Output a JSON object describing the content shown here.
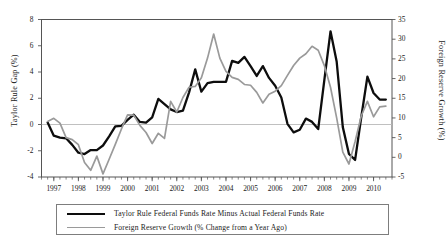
{
  "chart_data": {
    "type": "line",
    "title": "",
    "xlabel": "",
    "ylabel": "Taylor Rule Gap (%)",
    "y2label": "Foreign Reserve Growth (%)",
    "xlim": [
      1996.5,
      2010.75
    ],
    "ylim": [
      -4,
      8
    ],
    "y2lim": [
      -5,
      35
    ],
    "grid": false,
    "zero_line": true,
    "legend_position": "below-center",
    "y_ticks": [
      -4,
      -2,
      0,
      2,
      4,
      6,
      8
    ],
    "y2_ticks": [
      -5,
      0,
      5,
      10,
      15,
      20,
      25,
      30,
      35
    ],
    "x_ticks": [
      1997,
      1998,
      1999,
      2000,
      2001,
      2002,
      2003,
      2004,
      2005,
      2006,
      2007,
      2008,
      2009,
      2010
    ],
    "x_tick_labels": [
      "1997",
      "1998",
      "1999",
      "2000",
      "2001",
      "2002",
      "2003",
      "2004",
      "2005",
      "2006",
      "2007",
      "2008",
      "2009",
      "2010"
    ],
    "x_minor_tick_interval": 0.25,
    "series": [
      {
        "name": "Taylor Rule Federal Funds Rate Minus Actual Federal Funds Rate",
        "axis": "left",
        "color": "#0d0d0d",
        "width": 2.3,
        "x": [
          1996.75,
          1997.0,
          1997.25,
          1997.5,
          1997.75,
          1998.0,
          1998.25,
          1998.5,
          1998.75,
          1999.0,
          1999.25,
          1999.5,
          1999.75,
          2000.0,
          2000.25,
          2000.5,
          2000.75,
          2001.0,
          2001.25,
          2001.5,
          2001.75,
          2002.0,
          2002.25,
          2002.5,
          2002.75,
          2003.0,
          2003.25,
          2003.5,
          2003.75,
          2004.0,
          2004.25,
          2004.5,
          2004.75,
          2005.0,
          2005.25,
          2005.5,
          2005.75,
          2006.0,
          2006.25,
          2006.5,
          2006.75,
          2007.0,
          2007.25,
          2007.5,
          2007.75,
          2008.0,
          2008.25,
          2008.5,
          2008.75,
          2009.0,
          2009.25,
          2009.5,
          2009.75,
          2010.0,
          2010.25,
          2010.5
        ],
        "values": [
          0.15,
          -0.85,
          -1.0,
          -1.05,
          -1.55,
          -2.15,
          -2.25,
          -1.95,
          -1.95,
          -1.6,
          -0.9,
          -0.15,
          -0.1,
          0.35,
          0.75,
          0.2,
          0.15,
          0.55,
          1.95,
          1.55,
          1.15,
          0.95,
          1.05,
          2.45,
          4.2,
          2.5,
          3.15,
          3.25,
          3.25,
          3.25,
          4.85,
          4.7,
          5.15,
          4.45,
          3.7,
          4.45,
          3.55,
          2.95,
          2.05,
          0.05,
          -0.6,
          -0.4,
          0.45,
          0.2,
          -0.35,
          3.4,
          7.1,
          4.8,
          -0.2,
          -2.25,
          -2.7,
          0.55,
          3.65,
          2.4,
          1.9,
          1.9
        ]
      },
      {
        "name": "Foreign Reserve Growth (% Change from a Year Ago)",
        "axis": "right",
        "color": "#9a9a9a",
        "width": 1.7,
        "x": [
          1996.75,
          1997.0,
          1997.25,
          1997.5,
          1997.75,
          1998.0,
          1998.25,
          1998.5,
          1998.75,
          1999.0,
          1999.25,
          1999.5,
          1999.75,
          2000.0,
          2000.25,
          2000.5,
          2000.75,
          2001.0,
          2001.25,
          2001.5,
          2001.75,
          2002.0,
          2002.25,
          2002.5,
          2002.75,
          2003.0,
          2003.25,
          2003.5,
          2003.75,
          2004.0,
          2004.25,
          2004.5,
          2004.75,
          2005.0,
          2005.25,
          2005.5,
          2005.75,
          2006.0,
          2006.25,
          2006.5,
          2006.75,
          2007.0,
          2007.25,
          2007.5,
          2007.75,
          2008.0,
          2008.25,
          2008.5,
          2008.75,
          2009.0,
          2009.25,
          2009.5,
          2009.75,
          2010.0,
          2010.25,
          2010.5
        ],
        "values_left_scale": [
          0.4,
          0.65,
          0.3,
          -0.8,
          -0.95,
          -1.35,
          -2.7,
          -3.3,
          -2.2,
          -3.55,
          -2.15,
          -1.0,
          0.15,
          1.25,
          1.2,
          0.35,
          -0.1,
          -1.05,
          -0.2,
          -0.6,
          2.25,
          1.45,
          2.55,
          3.35,
          3.4,
          4.05,
          5.55,
          7.4,
          5.55,
          4.55,
          4.1,
          3.95,
          3.55,
          3.5,
          2.95,
          2.15,
          2.7,
          2.95,
          3.35,
          4.15,
          4.9,
          5.55,
          5.9,
          6.45,
          6.15,
          5.0,
          3.35,
          1.0,
          -1.6,
          -2.5,
          -0.8,
          1.15,
          2.25,
          1.1,
          1.85,
          1.9
        ],
        "values": [
          9.1,
          9.9,
          8.7,
          5.0,
          4.5,
          3.2,
          -1.3,
          -3.3,
          0.3,
          -4.2,
          -0.5,
          3.3,
          7.2,
          10.8,
          10.7,
          8.1,
          6.3,
          3.5,
          6.1,
          4.8,
          14.2,
          11.5,
          15.2,
          17.8,
          18.0,
          20.2,
          25.2,
          31.3,
          25.2,
          21.8,
          20.3,
          19.8,
          18.5,
          18.3,
          16.5,
          13.8,
          16.0,
          16.8,
          18.2,
          20.8,
          23.3,
          25.2,
          26.3,
          28.2,
          27.2,
          23.3,
          17.8,
          10.0,
          1.3,
          -1.7,
          4.0,
          10.5,
          14.2,
          10.3,
          12.8,
          13.0
        ]
      }
    ]
  },
  "axes": {
    "left_title": "Taylor Rule Gap (%)",
    "right_title": "Foreign Reserve Growth (%)"
  },
  "legend": {
    "entries": [
      {
        "label": "Taylor Rule Federal Funds Rate Minus Actual Federal Funds Rate",
        "color": "#0d0d0d"
      },
      {
        "label": "Foreign Reserve Growth (% Change from a Year Ago)",
        "color": "#9a9a9a"
      }
    ]
  }
}
